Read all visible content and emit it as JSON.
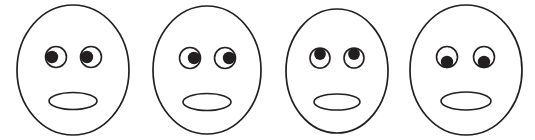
{
  "image": {
    "title": "Four cartoon faces with differing eye gaze directions",
    "width": 535,
    "height": 140,
    "background_color": "#ffffff",
    "ink_color": "#231f20"
  },
  "faces": [
    {
      "label": "face-1",
      "gaze": "left",
      "head": {
        "cx": 73,
        "cy": 70,
        "rx": 56,
        "ry": 65
      },
      "eyes": [
        {
          "label": "left-eye",
          "cx": 56,
          "cy": 57,
          "r": 10.5,
          "pupil": {
            "cx": 52,
            "cy": 57,
            "r": 6.2
          }
        },
        {
          "label": "right-eye",
          "cx": 91,
          "cy": 57,
          "r": 10.5,
          "pupil": {
            "cx": 87,
            "cy": 57,
            "r": 6.2
          }
        }
      ],
      "mouth": {
        "cx": 73,
        "cy": 101,
        "rx": 24,
        "ry": 8.5
      }
    },
    {
      "label": "face-2",
      "gaze": "right",
      "head": {
        "cx": 207,
        "cy": 70,
        "rx": 54,
        "ry": 64
      },
      "eyes": [
        {
          "label": "left-eye",
          "cx": 190,
          "cy": 58,
          "r": 10.5,
          "pupil": {
            "cx": 194,
            "cy": 58,
            "r": 6.2
          }
        },
        {
          "label": "right-eye",
          "cx": 225,
          "cy": 58,
          "r": 10.5,
          "pupil": {
            "cx": 229,
            "cy": 58,
            "r": 6.2
          }
        }
      ],
      "mouth": {
        "cx": 207,
        "cy": 102,
        "rx": 24,
        "ry": 8.5
      }
    },
    {
      "label": "face-3",
      "gaze": "up",
      "head": {
        "cx": 337,
        "cy": 71,
        "rx": 51,
        "ry": 62
      },
      "eyes": [
        {
          "label": "left-eye",
          "cx": 320,
          "cy": 58,
          "r": 10,
          "pupil": {
            "cx": 320,
            "cy": 54,
            "r": 5.9
          }
        },
        {
          "label": "right-eye",
          "cx": 354,
          "cy": 58,
          "r": 10,
          "pupil": {
            "cx": 354,
            "cy": 54,
            "r": 5.9
          }
        }
      ],
      "mouth": {
        "cx": 337,
        "cy": 102,
        "rx": 23,
        "ry": 8
      }
    },
    {
      "label": "face-4",
      "gaze": "down",
      "head": {
        "cx": 466,
        "cy": 70,
        "rx": 56,
        "ry": 65
      },
      "eyes": [
        {
          "label": "left-eye",
          "cx": 447,
          "cy": 57,
          "r": 10.5,
          "pupil": {
            "cx": 447,
            "cy": 62,
            "r": 6.2
          }
        },
        {
          "label": "right-eye",
          "cx": 484,
          "cy": 57,
          "r": 10.5,
          "pupil": {
            "cx": 484,
            "cy": 62,
            "r": 6.2
          }
        }
      ],
      "mouth": {
        "cx": 466,
        "cy": 101,
        "rx": 25,
        "ry": 9
      }
    }
  ]
}
